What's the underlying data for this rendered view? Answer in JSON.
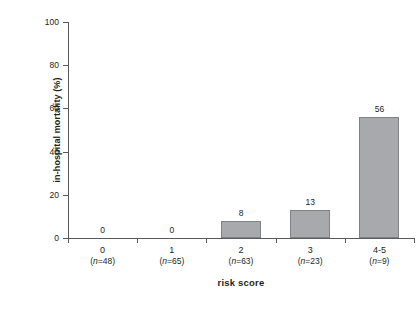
{
  "chart_data": {
    "type": "bar",
    "title": "",
    "xlabel": "risk score",
    "ylabel": "in-hospital mortality (%)",
    "categories": [
      "0",
      "1",
      "2",
      "3",
      "4-5"
    ],
    "group_sizes": [
      "(n=48)",
      "(n=65)",
      "(n=63)",
      "(n=23)",
      "(n=9)"
    ],
    "group_sizes_n": [
      48,
      65,
      63,
      23,
      9
    ],
    "values": [
      0,
      0,
      8,
      13,
      56
    ],
    "value_labels": [
      "0",
      "0",
      "8",
      "13",
      "56"
    ],
    "ylim": [
      0,
      100
    ],
    "yticks": [
      0,
      20,
      40,
      60,
      80,
      100
    ],
    "ytick_labels": [
      "0",
      "20",
      "40",
      "60",
      "80",
      "100"
    ],
    "grid": false,
    "legend": "none",
    "bar_fill_color": "#a7a9ac",
    "bar_border_color": "#808285",
    "axis_color": "#58595b",
    "text_color": "#231f20",
    "background_color": "#ffffff"
  }
}
